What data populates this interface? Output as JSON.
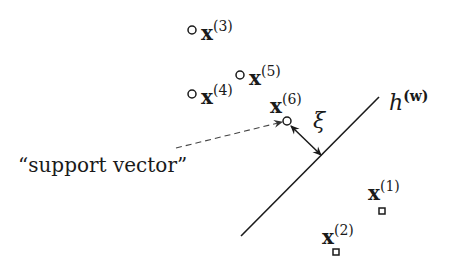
{
  "diagram": {
    "hyperplane": {
      "label_base": "h",
      "label_sup": "(w)",
      "x1": 241,
      "y1": 236,
      "x2": 379,
      "y2": 97
    },
    "margin": {
      "label": "ξ",
      "from": [
        291,
        126
      ],
      "to": [
        321,
        155
      ]
    },
    "annotation": {
      "text": "“support vector”",
      "pointer_from": [
        176,
        148
      ],
      "pointer_to": [
        282,
        122
      ]
    },
    "points": [
      {
        "id": "p1",
        "base": "x",
        "sup": "(1)",
        "marker": "square",
        "cx": 382,
        "cy": 211,
        "lx": 368,
        "ly": 200
      },
      {
        "id": "p2",
        "base": "x",
        "sup": "(2)",
        "marker": "square",
        "cx": 336,
        "cy": 252,
        "lx": 322,
        "ly": 244
      },
      {
        "id": "p3",
        "base": "x",
        "sup": "(3)",
        "marker": "circle",
        "cx": 192,
        "cy": 30,
        "lx": 201,
        "ly": 40
      },
      {
        "id": "p4",
        "base": "x",
        "sup": "(4)",
        "marker": "circle",
        "cx": 192,
        "cy": 94,
        "lx": 201,
        "ly": 104
      },
      {
        "id": "p5",
        "base": "x",
        "sup": "(5)",
        "marker": "circle",
        "cx": 240,
        "cy": 75,
        "lx": 249,
        "ly": 85
      },
      {
        "id": "p6",
        "base": "x",
        "sup": "(6)",
        "marker": "circle",
        "cx": 287,
        "cy": 121,
        "lx": 270,
        "ly": 113
      }
    ],
    "colors": {
      "ink": "#1a1a1a",
      "dash": "#444444",
      "background": "#ffffff"
    }
  }
}
